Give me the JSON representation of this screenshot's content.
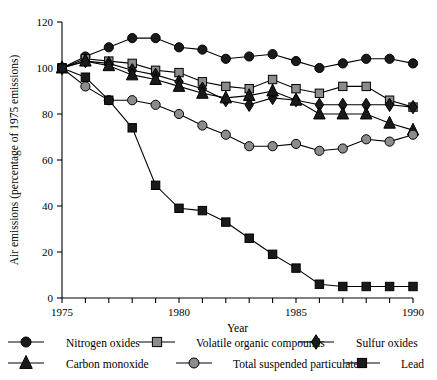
{
  "chart_data": {
    "type": "line",
    "title": "",
    "xlabel": "Year",
    "ylabel": "Air emissions (percentage of 1975 emissions)",
    "xlim": [
      1975,
      1990
    ],
    "ylim": [
      0,
      120
    ],
    "ytick_values": [
      0,
      20,
      40,
      60,
      80,
      100,
      120
    ],
    "ytick_labels": [
      "0",
      "20",
      "40",
      "60",
      "80",
      "100",
      "120"
    ],
    "xtick_values": [
      1975,
      1976,
      1977,
      1978,
      1979,
      1980,
      1981,
      1982,
      1983,
      1984,
      1985,
      1986,
      1987,
      1988,
      1989,
      1990
    ],
    "xtick_labels_shown": [
      "1975",
      "1980",
      "1985",
      "1990"
    ],
    "xtick_labels_shown_values": [
      1975,
      1980,
      1985,
      1990
    ],
    "grid": false,
    "legend_position": "below",
    "x": [
      1975,
      1976,
      1977,
      1978,
      1979,
      1980,
      1981,
      1982,
      1983,
      1984,
      1985,
      1986,
      1987,
      1988,
      1989,
      1990
    ],
    "series": [
      {
        "name": "Nitrogen oxides",
        "marker": "circle",
        "marker_fill": "#1a1a1a",
        "marker_edge": "#000000",
        "values": [
          100,
          105,
          109,
          113,
          113,
          109,
          108,
          104,
          105,
          106,
          103,
          100,
          102,
          104,
          104,
          102
        ]
      },
      {
        "name": "Volatile organic compounds",
        "marker": "square",
        "marker_fill": "#8c8c8c",
        "marker_edge": "#000000",
        "values": [
          100,
          104,
          103,
          102,
          99,
          98,
          94,
          92,
          91,
          95,
          91,
          89,
          92,
          92,
          86,
          83
        ]
      },
      {
        "name": "Sulfur oxides",
        "marker": "diamond",
        "marker_fill": "#1a1a1a",
        "marker_edge": "#000000",
        "values": [
          100,
          103,
          102,
          99,
          97,
          94,
          91,
          86,
          84,
          87,
          86,
          84,
          84,
          84,
          84,
          83
        ]
      },
      {
        "name": "Carbon monoxide",
        "marker": "triangle",
        "marker_fill": "#1a1a1a",
        "marker_edge": "#000000",
        "values": [
          100,
          103,
          101,
          97,
          95,
          92,
          89,
          87,
          88,
          90,
          86,
          80,
          80,
          80,
          76,
          73
        ]
      },
      {
        "name": "Total suspended particulates",
        "marker": "circle",
        "marker_fill": "#8c8c8c",
        "marker_edge": "#000000",
        "values": [
          100,
          92,
          86,
          86,
          84,
          80,
          75,
          71,
          66,
          66,
          67,
          64,
          65,
          69,
          68,
          71
        ]
      },
      {
        "name": "Lead",
        "marker": "square",
        "marker_fill": "#1a1a1a",
        "marker_edge": "#000000",
        "values": [
          100,
          96,
          86,
          74,
          49,
          39,
          38,
          33,
          26,
          19,
          13,
          6,
          5,
          5,
          5,
          5
        ]
      }
    ]
  },
  "legend": {
    "items": [
      {
        "label": "Nitrogen oxides"
      },
      {
        "label": "Volatile organic compounds"
      },
      {
        "label": "Sulfur oxides"
      },
      {
        "label": "Carbon monoxide"
      },
      {
        "label": "Total suspended particulates"
      },
      {
        "label": "Lead"
      }
    ]
  },
  "colors": {
    "axis": "#000000",
    "dark_marker": "#1a1a1a",
    "gray_marker": "#8c8c8c",
    "background": "#ffffff"
  }
}
